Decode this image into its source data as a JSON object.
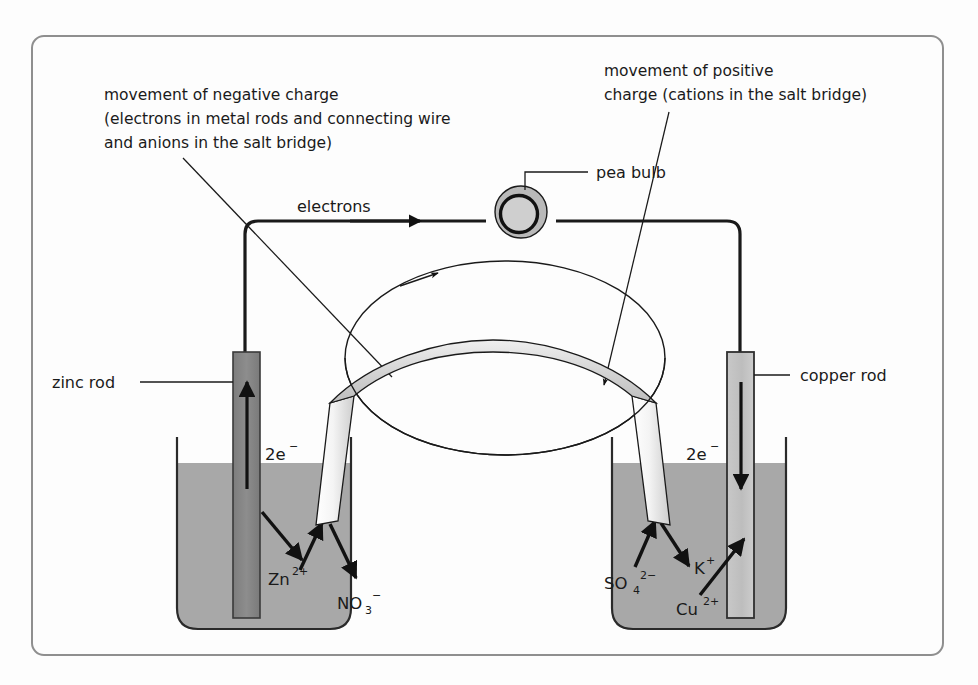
{
  "figure": {
    "frame_color": "#8f8f8f",
    "background_color": "#fdfdfd"
  },
  "annotations": {
    "negative_charge_note": {
      "line1": "movement of negative charge",
      "line2": "(electrons in metal rods and connecting wire",
      "line3": "and anions in the salt bridge)"
    },
    "positive_charge_note": {
      "line1": "movement of positive",
      "line2": "charge (cations in the salt bridge)"
    },
    "electrons_label": "electrons",
    "pea_bulb_label": "pea bulb",
    "zinc_rod_label": "zinc rod",
    "copper_rod_label": "copper rod"
  },
  "electrodes": {
    "left": {
      "name": "zinc rod",
      "electron_label_base": "2e",
      "electron_label_sup": "−",
      "fill_color": "#8a8a8a",
      "current_direction": "up"
    },
    "right": {
      "name": "copper rod",
      "electron_label_base": "2e",
      "electron_label_sup": "−",
      "fill_color": "#c2c2c2",
      "current_direction": "down"
    }
  },
  "ions": {
    "left_beaker": [
      {
        "base": "Zn",
        "sup": "2+",
        "sub": ""
      },
      {
        "base": "NO",
        "sub": "3",
        "sup": "−"
      }
    ],
    "right_beaker": [
      {
        "base": "SO",
        "sub": "4",
        "sup": "2−"
      },
      {
        "base": "K",
        "sub": "",
        "sup": "+"
      },
      {
        "base": "Cu",
        "sub": "",
        "sup": "2+"
      }
    ]
  },
  "solution": {
    "fill_color": "#a8a8a8",
    "beaker_outline_color": "#2a2a2a"
  },
  "salt_bridge": {
    "label": "salt bridge",
    "tube_fill_light": "#fbfbfb",
    "tube_fill_mid": "#d6d6d6"
  },
  "pea_bulb": {
    "outer_ring_color": "#b9b9b9",
    "inner_ring_color": "#111111",
    "glass_color": "#cfcfcf"
  }
}
